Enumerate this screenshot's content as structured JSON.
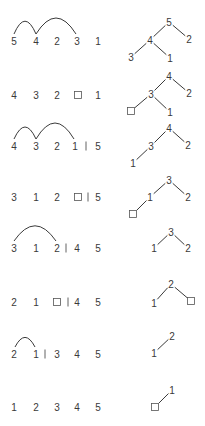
{
  "title": "Heapsort steps: array sequences with swap arcs and corresponding heap trees",
  "colors": {
    "ink": "#3a3a3a",
    "background": "#ffffff"
  },
  "slot_x": [
    14,
    36,
    57,
    77,
    98
  ],
  "rows": [
    {
      "y": 41,
      "items": [
        {
          "t": "5",
          "x": 14
        },
        {
          "t": "4",
          "x": 36
        },
        {
          "t": "2",
          "x": 57
        },
        {
          "t": "3",
          "x": 77
        },
        {
          "t": "1",
          "x": 98
        }
      ],
      "separator_x": null,
      "arcs": [
        {
          "x1": 14,
          "x2": 36,
          "h": 16
        },
        {
          "x1": 36,
          "x2": 76,
          "h": 20
        }
      ],
      "tree": {
        "nodes": [
          {
            "t": "5",
            "x": 169,
            "y": 22
          },
          {
            "t": "4",
            "x": 150,
            "y": 40
          },
          {
            "t": "2",
            "x": 189,
            "y": 39
          },
          {
            "t": "3",
            "x": 131,
            "y": 57
          },
          {
            "t": "1",
            "x": 170,
            "y": 58
          }
        ],
        "edges": [
          [
            0,
            1
          ],
          [
            0,
            2
          ],
          [
            1,
            3
          ],
          [
            1,
            4
          ]
        ]
      }
    },
    {
      "y": 95,
      "items": [
        {
          "t": "4",
          "x": 14
        },
        {
          "t": "3",
          "x": 36
        },
        {
          "t": "2",
          "x": 57
        },
        {
          "t": "□",
          "x": 78
        },
        {
          "t": "1",
          "x": 98
        }
      ],
      "separator_x": null,
      "arcs": [],
      "tree": {
        "nodes": [
          {
            "t": "4",
            "x": 169,
            "y": 76
          },
          {
            "t": "3",
            "x": 151,
            "y": 94
          },
          {
            "t": "2",
            "x": 189,
            "y": 93
          },
          {
            "t": "□",
            "x": 131,
            "y": 111
          },
          {
            "t": "1",
            "x": 170,
            "y": 112
          }
        ],
        "edges": [
          [
            0,
            1
          ],
          [
            0,
            2
          ],
          [
            1,
            3
          ],
          [
            1,
            4
          ]
        ]
      }
    },
    {
      "y": 146,
      "items": [
        {
          "t": "4",
          "x": 14
        },
        {
          "t": "3",
          "x": 36
        },
        {
          "t": "2",
          "x": 57
        },
        {
          "t": "1",
          "x": 75
        },
        {
          "t": "5",
          "x": 98
        }
      ],
      "separator_x": 86,
      "arcs": [
        {
          "x1": 14,
          "x2": 36,
          "h": 15
        },
        {
          "x1": 36,
          "x2": 74,
          "h": 20
        }
      ],
      "tree": {
        "nodes": [
          {
            "t": "4",
            "x": 169,
            "y": 128
          },
          {
            "t": "3",
            "x": 151,
            "y": 146
          },
          {
            "t": "2",
            "x": 188,
            "y": 145
          },
          {
            "t": "1",
            "x": 133,
            "y": 163
          }
        ],
        "edges": [
          [
            0,
            1
          ],
          [
            0,
            2
          ],
          [
            1,
            3
          ]
        ]
      }
    },
    {
      "y": 197,
      "items": [
        {
          "t": "3",
          "x": 14
        },
        {
          "t": "1",
          "x": 36
        },
        {
          "t": "2",
          "x": 57
        },
        {
          "t": "□",
          "x": 78
        },
        {
          "t": "5",
          "x": 98
        }
      ],
      "separator_x": 88,
      "arcs": [],
      "tree": {
        "nodes": [
          {
            "t": "3",
            "x": 169,
            "y": 180
          },
          {
            "t": "1",
            "x": 150,
            "y": 197
          },
          {
            "t": "2",
            "x": 188,
            "y": 197
          },
          {
            "t": "□",
            "x": 133,
            "y": 214
          }
        ],
        "edges": [
          [
            0,
            1
          ],
          [
            0,
            2
          ],
          [
            1,
            3
          ]
        ]
      }
    },
    {
      "y": 248,
      "items": [
        {
          "t": "3",
          "x": 14
        },
        {
          "t": "1",
          "x": 36
        },
        {
          "t": "2",
          "x": 57
        },
        {
          "t": "4",
          "x": 77
        },
        {
          "t": "5",
          "x": 98
        }
      ],
      "separator_x": 66,
      "arcs": [
        {
          "x1": 14,
          "x2": 56,
          "h": 19
        }
      ],
      "tree": {
        "nodes": [
          {
            "t": "3",
            "x": 171,
            "y": 232
          },
          {
            "t": "1",
            "x": 154,
            "y": 248
          },
          {
            "t": "2",
            "x": 188,
            "y": 248
          }
        ],
        "edges": [
          [
            0,
            1
          ],
          [
            0,
            2
          ]
        ]
      }
    },
    {
      "y": 302,
      "items": [
        {
          "t": "2",
          "x": 14
        },
        {
          "t": "1",
          "x": 36
        },
        {
          "t": "□",
          "x": 57
        },
        {
          "t": "4",
          "x": 77
        },
        {
          "t": "5",
          "x": 98
        }
      ],
      "separator_x": 68,
      "arcs": [],
      "tree": {
        "nodes": [
          {
            "t": "2",
            "x": 171,
            "y": 284
          },
          {
            "t": "1",
            "x": 154,
            "y": 303
          },
          {
            "t": "□",
            "x": 191,
            "y": 301
          }
        ],
        "edges": [
          [
            0,
            1
          ],
          [
            0,
            2
          ]
        ]
      }
    },
    {
      "y": 354,
      "items": [
        {
          "t": "2",
          "x": 14
        },
        {
          "t": "1",
          "x": 36
        },
        {
          "t": "3",
          "x": 57
        },
        {
          "t": "4",
          "x": 77
        },
        {
          "t": "5",
          "x": 98
        }
      ],
      "separator_x": 45,
      "arcs": [
        {
          "x1": 15,
          "x2": 35,
          "h": 12
        }
      ],
      "tree": {
        "nodes": [
          {
            "t": "2",
            "x": 172,
            "y": 336
          },
          {
            "t": "1",
            "x": 154,
            "y": 353
          }
        ],
        "edges": [
          [
            0,
            1
          ]
        ]
      }
    },
    {
      "y": 407,
      "items": [
        {
          "t": "1",
          "x": 14
        },
        {
          "t": "2",
          "x": 36
        },
        {
          "t": "3",
          "x": 57
        },
        {
          "t": "4",
          "x": 77
        },
        {
          "t": "5",
          "x": 98
        }
      ],
      "separator_x": null,
      "arcs": [],
      "tree": {
        "nodes": [
          {
            "t": "1",
            "x": 172,
            "y": 390
          },
          {
            "t": "□",
            "x": 155,
            "y": 407
          }
        ],
        "edges": [
          [
            0,
            1
          ]
        ]
      }
    }
  ]
}
